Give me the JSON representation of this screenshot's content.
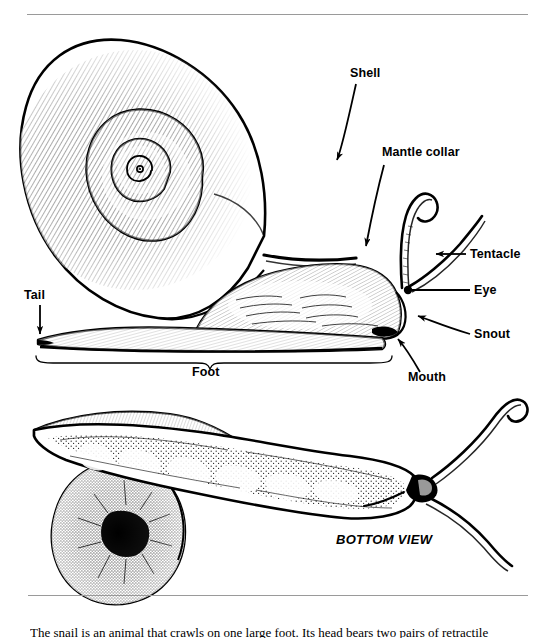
{
  "page": {
    "background_color": "#ffffff",
    "ink_color": "#000000",
    "rule_color": "#9a9a9a",
    "width": 555,
    "height": 638
  },
  "rules": [
    {
      "name": "top-rule",
      "x": 27,
      "y": 14,
      "width": 501
    },
    {
      "name": "bottom-rule",
      "x": 28,
      "y": 595,
      "width": 500
    }
  ],
  "figure": {
    "views": [
      {
        "name": "side-view",
        "caption": ""
      },
      {
        "name": "bottom-view",
        "caption": "BOTTOM VIEW"
      }
    ]
  },
  "labels": {
    "shell": "Shell",
    "mantle_collar": "Mantle collar",
    "tentacle": "Tentacle",
    "eye": "Eye",
    "snout": "Snout",
    "mouth": "Mouth",
    "tail": "Tail",
    "foot": "Foot",
    "bottom_view": "BOTTOM VIEW"
  },
  "caption": {
    "text": "The snail is an animal that crawls on one large foot. Its head bears two pairs of retractile tentacles; the"
  }
}
